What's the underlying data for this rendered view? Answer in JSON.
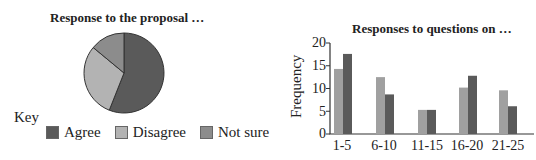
{
  "pie": {
    "title": "Response to the proposal …",
    "key_label": "Key",
    "legend": [
      {
        "label": "Agree",
        "color": "#5a5a5a"
      },
      {
        "label": "Disagree",
        "color": "#b3b3b3"
      },
      {
        "label": "Not sure",
        "color": "#8c8c8c"
      }
    ]
  },
  "bar": {
    "title": "Responses to questions on …",
    "ylabel": "Frequency",
    "yticks": [
      "0",
      "5",
      "10",
      "15",
      "20"
    ],
    "xticks": [
      "1-5",
      "6-10",
      "11-15",
      "16-20",
      "21-25"
    ]
  },
  "chart_data": [
    {
      "type": "pie",
      "title": "Response to the proposal …",
      "categories": [
        "Agree",
        "Disagree",
        "Not sure"
      ],
      "values": [
        56,
        30,
        14
      ],
      "colors": [
        "#5a5a5a",
        "#b3b3b3",
        "#8c8c8c"
      ],
      "legend_title": "Key",
      "legend_position": "bottom"
    },
    {
      "type": "bar",
      "title": "Responses to questions on …",
      "xlabel": "",
      "ylabel": "Frequency",
      "categories": [
        "1-5",
        "6-10",
        "11-15",
        "16-20",
        "21-25"
      ],
      "series": [
        {
          "name": "Series 1 (light)",
          "color": "#a0a0a0",
          "values": [
            14.3,
            12.5,
            5.3,
            10.2,
            9.6
          ]
        },
        {
          "name": "Series 2 (dark)",
          "color": "#5a5a5a",
          "values": [
            17.6,
            8.7,
            5.3,
            12.8,
            6.1
          ]
        }
      ],
      "ylim": [
        0,
        20
      ],
      "grid": false
    }
  ]
}
